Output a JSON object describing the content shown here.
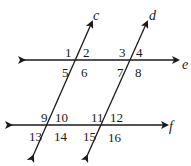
{
  "diagram": {
    "type": "parallel-lines-transversals",
    "lines": [
      {
        "name": "c",
        "role": "transversal"
      },
      {
        "name": "d",
        "role": "transversal"
      },
      {
        "name": "e",
        "role": "horizontal"
      },
      {
        "name": "f",
        "role": "horizontal"
      }
    ],
    "line_labels": {
      "c": "c",
      "d": "d",
      "e": "e",
      "f": "f"
    },
    "angles": {
      "a1": "1",
      "a2": "2",
      "a3": "3",
      "a4": "4",
      "a5": "5",
      "a6": "6",
      "a7": "7",
      "a8": "8",
      "a9": "9",
      "a10": "10",
      "a11": "11",
      "a12": "12",
      "a13": "13",
      "a14": "14",
      "a15": "15",
      "a16": "16"
    },
    "colors": {
      "stroke": "#1a1a1a",
      "background": "#ffffff"
    }
  }
}
